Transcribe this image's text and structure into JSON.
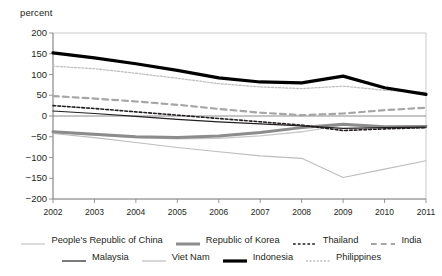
{
  "axis_unit_label": "percent",
  "yticks": [
    "200",
    "150",
    "100",
    "50",
    "0",
    "-50",
    "-100",
    "-150",
    "-200"
  ],
  "xticks": [
    "2002",
    "2003",
    "2004",
    "2005",
    "2006",
    "2007",
    "2008",
    "2009",
    "2010",
    "2011"
  ],
  "legend": {
    "row1": [
      {
        "label": "People's Republic of China",
        "key": "prc"
      },
      {
        "label": "Republic of Korea",
        "key": "kor"
      },
      {
        "label": "Thailand",
        "key": "tha"
      },
      {
        "label": "India",
        "key": "ind"
      }
    ],
    "row2": [
      {
        "label": "Malaysia",
        "key": "mys"
      },
      {
        "label": "Viet Nam",
        "key": "vnm"
      },
      {
        "label": "Indonesia",
        "key": "idn"
      },
      {
        "label": "Philippines",
        "key": "phl"
      }
    ]
  },
  "colors": {
    "axis": "#7f7f7f",
    "gridline": "#bfbfbf",
    "text": "#231f20",
    "prc": "#c9c9c9",
    "kor": "#8c8c8c",
    "tha": "#231f20",
    "ind": "#a6a6a6",
    "mys": "#231f20",
    "vnm": "#bdbdbd",
    "idn": "#000000",
    "phl": "#c0c0c0"
  },
  "chart_data": {
    "type": "line",
    "title": "",
    "subtitle": "",
    "xlabel": "",
    "ylabel": "percent",
    "ylim": [
      -200,
      200
    ],
    "ytick_step": 50,
    "grid": false,
    "zero_line": true,
    "legend_position": "bottom",
    "x": [
      2002,
      2003,
      2004,
      2005,
      2006,
      2007,
      2008,
      2009,
      2010,
      2011
    ],
    "series": [
      {
        "name": "Indonesia",
        "key": "idn",
        "style": "solid",
        "width": 3.2,
        "color": "#000000",
        "values": [
          152,
          140,
          126,
          110,
          92,
          82,
          80,
          96,
          68,
          52
        ]
      },
      {
        "name": "Philippines",
        "key": "phl",
        "style": "fine-dotted",
        "width": 1.3,
        "color": "#c0c0c0",
        "values": [
          120,
          114,
          103,
          91,
          78,
          70,
          66,
          72,
          62,
          57
        ]
      },
      {
        "name": "India",
        "key": "ind",
        "style": "dashed",
        "width": 2.2,
        "color": "#a6a6a6",
        "values": [
          48,
          42,
          35,
          27,
          17,
          8,
          2,
          6,
          14,
          20
        ]
      },
      {
        "name": "Thailand",
        "key": "tha",
        "style": "dotted",
        "width": 1.6,
        "color": "#231f20",
        "values": [
          25,
          18,
          10,
          2,
          -6,
          -14,
          -22,
          -35,
          -31,
          -28
        ]
      },
      {
        "name": "Malaysia",
        "key": "mys",
        "style": "solid",
        "width": 1.2,
        "color": "#231f20",
        "values": [
          12,
          6,
          -1,
          -8,
          -14,
          -19,
          -24,
          -30,
          -28,
          -27
        ]
      },
      {
        "name": "Republic of Korea",
        "key": "kor",
        "style": "solid",
        "width": 3.0,
        "color": "#8c8c8c",
        "values": [
          -38,
          -44,
          -50,
          -52,
          -48,
          -40,
          -28,
          -20,
          -26,
          -25
        ]
      },
      {
        "name": "People's Republic of China",
        "key": "prc",
        "style": "solid",
        "width": 1.3,
        "color": "#c9c9c9",
        "values": [
          -40,
          -46,
          -52,
          -55,
          -54,
          -48,
          -38,
          -22,
          -29,
          -30
        ]
      },
      {
        "name": "Viet Nam",
        "key": "vnm",
        "style": "solid",
        "width": 1.1,
        "color": "#bdbdbd",
        "values": [
          -42,
          -52,
          -64,
          -76,
          -86,
          -96,
          -102,
          -148,
          -128,
          -108
        ]
      }
    ]
  }
}
